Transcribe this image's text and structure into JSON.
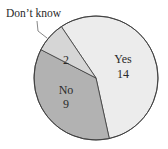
{
  "chart_data": {
    "type": "pie",
    "title": "",
    "categories": [
      "Yes",
      "No",
      "Don't know"
    ],
    "values": [
      14,
      9,
      2
    ],
    "slices": [
      {
        "label": "Yes",
        "value": 14,
        "color": "#ececec"
      },
      {
        "label": "No",
        "value": 9,
        "color": "#b2b2b2"
      },
      {
        "label": "Don’t know",
        "value": 2,
        "color": "#d6d6d6"
      }
    ],
    "start_angle_deg": -34,
    "direction": "clockwise",
    "legend": "none",
    "callout": {
      "label": "Don’t know",
      "target": "Don’t know"
    }
  },
  "labels": {
    "yes_name": "Yes",
    "yes_value": "14",
    "no_name": "No",
    "no_value": "9",
    "dk_value": "2",
    "dk_callout": "Don’t know"
  }
}
